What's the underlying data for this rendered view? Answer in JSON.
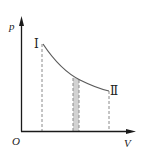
{
  "diagram": {
    "type": "p-V process curve",
    "axes": {
      "y_label": "p",
      "x_label": "V",
      "origin_label": "O"
    },
    "states": [
      {
        "label": "Ⅰ",
        "name": "state-1"
      },
      {
        "label": "Ⅱ",
        "name": "state-2"
      }
    ],
    "curve": "decreasing curve from state Ⅰ to state Ⅱ",
    "shaded_strip": "narrow vertical strip under curve between dashed lines",
    "colors": {
      "axis": "#1a1a1a",
      "curve": "#555555",
      "dashed": "#888888",
      "shade": "#cfcfcf"
    }
  }
}
